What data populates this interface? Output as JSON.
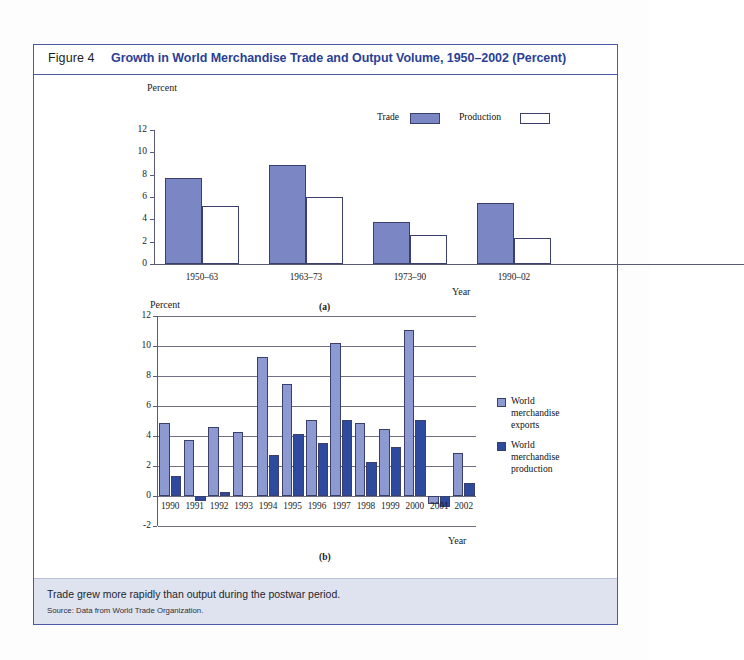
{
  "figure": {
    "number": "Figure 4",
    "title": "Growth in World Merchandise Trade and Output Volume, 1950–2002 (Percent)",
    "panel_a_label": "(a)",
    "panel_b_label": "(b)",
    "caption": "Trade grew more rapidly than output during the postwar period.",
    "source": "Source: Data from World Trade Organization."
  },
  "colors": {
    "border": "#4a5aa8",
    "title": "#2b3f96",
    "footer_bg": "#dfe3f0",
    "trade_bar": "#7a87c4",
    "production_bar": "#ffffff",
    "exports_bar": "#8d9ad2",
    "production_b_bar": "#2e4a9e",
    "bar_outline": "#3a3f6b",
    "axis": "#5a5a7a"
  },
  "chart_data": [
    {
      "id": "panel-a",
      "type": "bar",
      "title": "",
      "xlabel": "Year",
      "ylabel": "Percent",
      "ylim": [
        0,
        12
      ],
      "yticks": [
        0,
        2,
        4,
        6,
        8,
        10,
        12
      ],
      "grid": false,
      "legend_position": "top-right",
      "categories": [
        "1950–63",
        "1963–73",
        "1973–90",
        "1990–02"
      ],
      "series": [
        {
          "name": "Trade",
          "values": [
            7.7,
            8.9,
            3.8,
            5.5
          ]
        },
        {
          "name": "Production",
          "values": [
            5.2,
            6.0,
            2.6,
            2.3
          ]
        }
      ]
    },
    {
      "id": "panel-b",
      "type": "bar",
      "title": "",
      "xlabel": "Year",
      "ylabel": "Percent",
      "ylim": [
        -2,
        12
      ],
      "yticks": [
        -2,
        0,
        2,
        4,
        6,
        8,
        10,
        12
      ],
      "grid": true,
      "legend_position": "right",
      "categories": [
        "1990",
        "1991",
        "1992",
        "1993",
        "1994",
        "1995",
        "1996",
        "1997",
        "1998",
        "1999",
        "2000",
        "2001",
        "2002"
      ],
      "series": [
        {
          "name": "World merchandise exports",
          "values": [
            4.9,
            3.75,
            4.6,
            4.25,
            9.25,
            7.5,
            5.1,
            10.2,
            4.85,
            4.5,
            11.1,
            -0.5,
            2.9
          ]
        },
        {
          "name": "World merchandise production",
          "values": [
            1.35,
            -0.35,
            0.25,
            0.0,
            2.75,
            4.15,
            3.55,
            5.1,
            2.25,
            3.3,
            5.1,
            -0.7,
            0.9
          ]
        }
      ]
    }
  ]
}
